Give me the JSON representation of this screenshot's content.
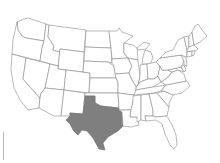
{
  "map": {
    "title": "United States",
    "highlighted_state": "Texas",
    "colors": {
      "background": "#ffffff",
      "state_fill": "#ffffff",
      "state_stroke": "#8a8a8a",
      "highlight_fill": "#7f7f7f"
    },
    "states": [
      {
        "id": "WA",
        "name": "Washington"
      },
      {
        "id": "OR",
        "name": "Oregon"
      },
      {
        "id": "CA",
        "name": "California"
      },
      {
        "id": "ID",
        "name": "Idaho"
      },
      {
        "id": "NV",
        "name": "Nevada"
      },
      {
        "id": "MT",
        "name": "Montana"
      },
      {
        "id": "WY",
        "name": "Wyoming"
      },
      {
        "id": "UT",
        "name": "Utah"
      },
      {
        "id": "AZ",
        "name": "Arizona"
      },
      {
        "id": "CO",
        "name": "Colorado"
      },
      {
        "id": "NM",
        "name": "New Mexico"
      },
      {
        "id": "ND",
        "name": "North Dakota"
      },
      {
        "id": "SD",
        "name": "South Dakota"
      },
      {
        "id": "NE",
        "name": "Nebraska"
      },
      {
        "id": "KS",
        "name": "Kansas"
      },
      {
        "id": "OK",
        "name": "Oklahoma"
      },
      {
        "id": "TX",
        "name": "Texas",
        "highlighted": true
      },
      {
        "id": "MN",
        "name": "Minnesota"
      },
      {
        "id": "IA",
        "name": "Iowa"
      },
      {
        "id": "MO",
        "name": "Missouri"
      },
      {
        "id": "AR",
        "name": "Arkansas"
      },
      {
        "id": "LA",
        "name": "Louisiana"
      },
      {
        "id": "WI",
        "name": "Wisconsin"
      },
      {
        "id": "IL",
        "name": "Illinois"
      },
      {
        "id": "MI",
        "name": "Michigan"
      },
      {
        "id": "IN",
        "name": "Indiana"
      },
      {
        "id": "OH",
        "name": "Ohio"
      },
      {
        "id": "KY",
        "name": "Kentucky"
      },
      {
        "id": "TN",
        "name": "Tennessee"
      },
      {
        "id": "MS",
        "name": "Mississippi"
      },
      {
        "id": "AL",
        "name": "Alabama"
      },
      {
        "id": "GA",
        "name": "Georgia"
      },
      {
        "id": "FL",
        "name": "Florida"
      },
      {
        "id": "SC",
        "name": "South Carolina"
      },
      {
        "id": "NC",
        "name": "North Carolina"
      },
      {
        "id": "VA",
        "name": "Virginia"
      },
      {
        "id": "WV",
        "name": "West Virginia"
      },
      {
        "id": "PA",
        "name": "Pennsylvania"
      },
      {
        "id": "NY",
        "name": "New York"
      },
      {
        "id": "VT",
        "name": "Vermont"
      },
      {
        "id": "NH",
        "name": "New Hampshire"
      },
      {
        "id": "ME",
        "name": "Maine"
      },
      {
        "id": "MA",
        "name": "Massachusetts"
      },
      {
        "id": "CT",
        "name": "Connecticut"
      },
      {
        "id": "RI",
        "name": "Rhode Island"
      },
      {
        "id": "NJ",
        "name": "New Jersey"
      },
      {
        "id": "DE",
        "name": "Delaware"
      },
      {
        "id": "MD",
        "name": "Maryland"
      }
    ]
  }
}
